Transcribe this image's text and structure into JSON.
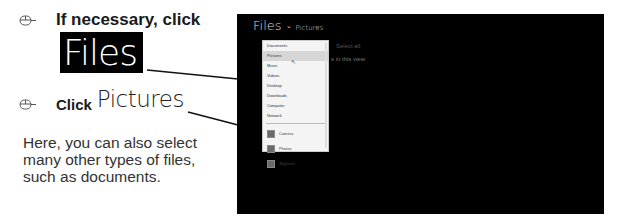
{
  "instructions": {
    "step1": {
      "label": "If necessary, click",
      "target": "Files"
    },
    "step2": {
      "label": "Click",
      "target": "Pictures"
    },
    "note": "Here, you can also select many other types of files, such as documents."
  },
  "screen": {
    "title": "Files",
    "chevron": "⌄",
    "subtitle": "Pictures",
    "select_all": "Select all",
    "in_view": "s in this view",
    "dropdown": {
      "items": [
        {
          "label": "Documents",
          "active": false
        },
        {
          "label": "Pictures",
          "active": true
        },
        {
          "label": "Music",
          "active": false
        },
        {
          "label": "Videos",
          "active": false
        },
        {
          "label": "Desktop",
          "active": false
        },
        {
          "label": "Downloads",
          "active": false
        },
        {
          "label": "Computer",
          "active": false
        },
        {
          "label": "Network",
          "active": false
        }
      ],
      "libraries": [
        {
          "label": "Camera",
          "icon": "camera-roll-icon"
        },
        {
          "label": "Photos",
          "icon": "photos-icon"
        },
        {
          "label": "SkyDrive",
          "icon": "skydrive-icon"
        }
      ]
    }
  },
  "colors": {
    "screen_bg": "#000000",
    "highlight": "#d6d6d6",
    "text_dark": "#1a1a1a"
  }
}
